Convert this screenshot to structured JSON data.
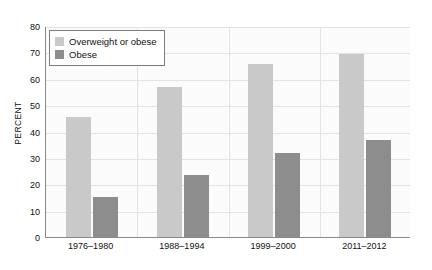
{
  "chart_data": {
    "type": "bar",
    "title": "",
    "xlabel": "",
    "ylabel": "PERCENT",
    "ylim": [
      0,
      80
    ],
    "yticks": [
      0,
      10,
      20,
      30,
      40,
      50,
      60,
      70,
      80
    ],
    "grid": true,
    "legend_position": "top-left",
    "categories": [
      "1976–1980",
      "1988–1994",
      "1999–2000",
      "2011–2012"
    ],
    "series": [
      {
        "name": "Overweight or obese",
        "color": "#c9c9c9",
        "values": [
          45.5,
          56.8,
          65.5,
          69.3
        ]
      },
      {
        "name": "Obese",
        "color": "#8d8d8d",
        "values": [
          15.2,
          23.5,
          31.8,
          36.7
        ]
      }
    ]
  },
  "legend": {
    "items": [
      {
        "label": "Overweight or obese",
        "swatch": "light"
      },
      {
        "label": "Obese",
        "swatch": "dark"
      }
    ]
  },
  "colors": {
    "light_bar": "#c9c9c9",
    "dark_bar": "#8d8d8d",
    "gridline": "#e3e3e3",
    "axis": "#8a8a8a",
    "plot_background": "#fbfbfb",
    "text": "#111111"
  }
}
